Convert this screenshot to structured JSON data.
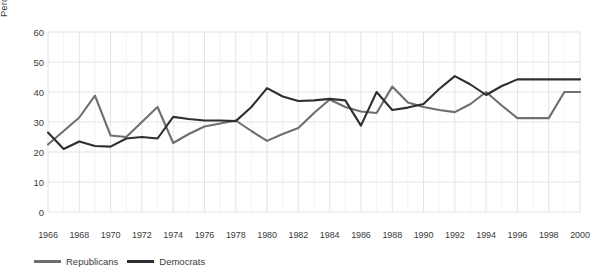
{
  "chart_data": {
    "type": "line",
    "title": "",
    "xlabel": "",
    "ylabel": "Percent responding",
    "xlim": [
      1966,
      2000
    ],
    "ylim": [
      0,
      65
    ],
    "grid": true,
    "legend_position": "bottom-left",
    "y_ticks": [
      0,
      10,
      20,
      30,
      40,
      50,
      60
    ],
    "x_ticks": [
      1966,
      1968,
      1970,
      1972,
      1974,
      1976,
      1978,
      1980,
      1982,
      1984,
      1986,
      1988,
      1990,
      1992,
      1994,
      1996,
      1998,
      2000
    ],
    "x": [
      1966,
      1967,
      1968,
      1969,
      1970,
      1971,
      1972,
      1973,
      1974,
      1975,
      1976,
      1977,
      1978,
      1979,
      1980,
      1981,
      1982,
      1983,
      1984,
      1985,
      1986,
      1987,
      1988,
      1989,
      1990,
      1991,
      1992,
      1993,
      1994,
      1995,
      1996,
      1997,
      1998,
      1999,
      2000
    ],
    "series": [
      {
        "name": "Republicans",
        "color": "#6f6f6f",
        "values": [
          22.5,
          27.0,
          31.5,
          38.8,
          25.5,
          25.0,
          30.0,
          35.0,
          23.0,
          26.0,
          28.5,
          29.5,
          30.5,
          27.0,
          23.7,
          26.0,
          28.0,
          33.0,
          37.5,
          35.0,
          33.5,
          33.0,
          41.8,
          36.5,
          35.0,
          34.0,
          33.3,
          36.0,
          40.0,
          35.5,
          31.3,
          31.3,
          31.3,
          40.0,
          40.0
        ]
      },
      {
        "name": "Democrats",
        "color": "#2f2f2f",
        "values": [
          26.5,
          21.0,
          23.5,
          22.0,
          21.8,
          24.5,
          25.0,
          24.5,
          31.7,
          31.0,
          30.5,
          30.5,
          30.3,
          35.0,
          41.3,
          38.5,
          37.0,
          37.2,
          37.7,
          37.2,
          28.8,
          40.0,
          34.0,
          34.8,
          36.0,
          41.0,
          45.3,
          42.5,
          39.0,
          42.0,
          44.2,
          44.2,
          44.2,
          44.2,
          44.2
        ]
      }
    ]
  },
  "legend": {
    "items": [
      {
        "label": "Republicans",
        "color": "#6f6f6f"
      },
      {
        "label": "Democrats",
        "color": "#2f2f2f"
      }
    ]
  },
  "style": {
    "grid_color": "#e3e3e8",
    "text_color": "#3b3b3b",
    "background": "#ffffff"
  }
}
